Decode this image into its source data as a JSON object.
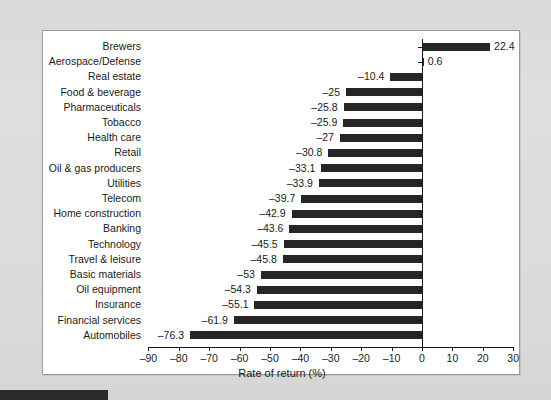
{
  "chart_data": {
    "type": "bar",
    "orientation": "horizontal",
    "title": "",
    "xlabel": "Rate of return (%)",
    "ylabel": "",
    "xlim": [
      -90,
      30
    ],
    "xticks": [
      -90,
      -80,
      -70,
      -60,
      -50,
      -40,
      -30,
      -20,
      -10,
      0,
      10,
      20,
      30
    ],
    "xtick_labels": [
      "–90",
      "–80",
      "–70",
      "–60",
      "–50",
      "–40",
      "–30",
      "–20",
      "–10",
      "0",
      "10",
      "20",
      "30"
    ],
    "grid": false,
    "legend": null,
    "bar_color": "#262626",
    "categories": [
      "Brewers",
      "Aerospace/Defense",
      "Real estate",
      "Food & beverage",
      "Pharmaceuticals",
      "Tobacco",
      "Health care",
      "Retail",
      "Oil & gas producers",
      "Utilities",
      "Telecom",
      "Home construction",
      "Banking",
      "Technology",
      "Travel & leisure",
      "Basic materials",
      "Oil equipment",
      "Insurance",
      "Financial services",
      "Automobiles"
    ],
    "values": [
      22.4,
      0.6,
      -10.4,
      -25,
      -25.8,
      -25.9,
      -27,
      -30.8,
      -33.1,
      -33.9,
      -39.7,
      -42.9,
      -43.6,
      -45.5,
      -45.8,
      -53,
      -54.3,
      -55.1,
      -61.9,
      -76.3
    ],
    "value_labels": [
      "22.4",
      "0.6",
      "–10.4",
      "–25",
      "–25.8",
      "–25.9",
      "–27",
      "–30.8",
      "–33.1",
      "–33.9",
      "–39.7",
      "–42.9",
      "–43.6",
      "–45.5",
      "–45.8",
      "–53",
      "–54.3",
      "–55.1",
      "–61.9",
      "–76.3"
    ]
  }
}
